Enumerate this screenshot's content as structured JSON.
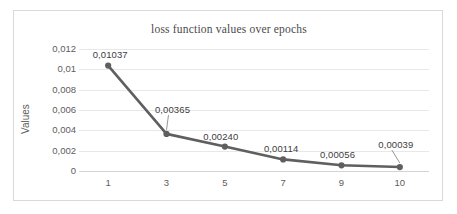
{
  "chart_data": {
    "type": "line",
    "title": "loss function values over epochs",
    "xlabel": "",
    "ylabel": "Values",
    "x": [
      1,
      3,
      5,
      7,
      9,
      10
    ],
    "categories": [
      "1",
      "3",
      "5",
      "7",
      "9",
      "10"
    ],
    "values": [
      0.01037,
      0.00365,
      0.0024,
      0.00114,
      0.00056,
      0.00039
    ],
    "point_labels": [
      "0,01037",
      "0,00365",
      "0,00240",
      "0,00114",
      "0,00056",
      "0,00039"
    ],
    "y_tick_labels": [
      "0,012",
      "0,01",
      "0,008",
      "0,006",
      "0,004",
      "0,002",
      "0"
    ],
    "y_tick_values": [
      0.012,
      0.01,
      0.008,
      0.006,
      0.004,
      0.002,
      0
    ],
    "ylim": [
      0,
      0.012
    ],
    "grid": "horizontal-only",
    "legend": "none",
    "series_color": "#5f5f5f",
    "marker": "circle",
    "decimal_separator": ","
  },
  "frame": {
    "border_color": "#d9d9d9",
    "background": "#ffffff"
  }
}
